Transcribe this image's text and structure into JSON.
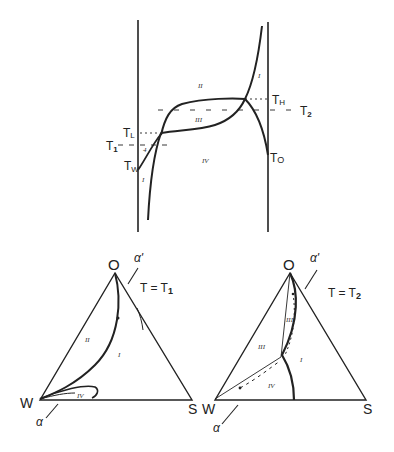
{
  "top_diagram": {
    "labels": {
      "T_H": "T",
      "T_H_sub": "H",
      "T_2": "T",
      "T_2_sub": "2",
      "T_L": "T",
      "T_L_sub": "L",
      "T_1": "T",
      "T_1_sub": "1",
      "T_W": "T",
      "T_W_sub": "W",
      "T_O": "T",
      "T_O_sub": "O"
    },
    "regions": {
      "r_I_right": "I",
      "r_II": "II",
      "r_III": "III",
      "r_IV": "IV",
      "r_I_left": "I",
      "r_small": "4"
    }
  },
  "left_triangle": {
    "vertex_top": "O",
    "vertex_left": "W",
    "vertex_right": "S",
    "alpha_top": "α'",
    "alpha_bottom": "α",
    "condition": "T = T",
    "condition_sub": "1",
    "regions": {
      "r_II": "II",
      "r_I": "I",
      "r_IV": "IV"
    }
  },
  "right_triangle": {
    "vertex_top": "O",
    "vertex_left": "W",
    "vertex_right": "S",
    "alpha_top": "α'",
    "alpha_bottom": "α",
    "condition": "T = T",
    "condition_sub": "2",
    "regions": {
      "r_III_upper": "III",
      "r_III": "III",
      "r_I": "I",
      "r_IV": "IV"
    }
  }
}
